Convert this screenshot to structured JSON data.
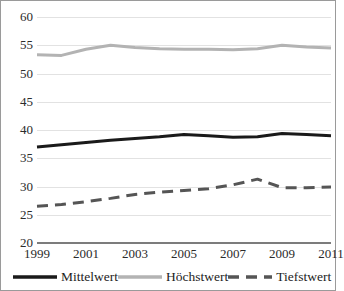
{
  "chart_data": {
    "type": "line",
    "title": "",
    "subtitle": "",
    "xlabel": "",
    "ylabel": "",
    "x": [
      1999,
      2000,
      2001,
      2002,
      2003,
      2004,
      2005,
      2006,
      2007,
      2008,
      2009,
      2010,
      2011
    ],
    "xtick_labels": [
      "1999",
      "2001",
      "2003",
      "2005",
      "2007",
      "2009",
      "2011"
    ],
    "xtick_values": [
      1999,
      2001,
      2003,
      2005,
      2007,
      2009,
      2011
    ],
    "xlim": [
      1999,
      2011
    ],
    "ylim": [
      20,
      60
    ],
    "ytick_labels": [
      "20",
      "25",
      "30",
      "35",
      "40",
      "45",
      "50",
      "55",
      "60"
    ],
    "ytick_values": [
      20,
      25,
      30,
      35,
      40,
      45,
      50,
      55,
      60
    ],
    "grid": true,
    "legend_position": "bottom",
    "series": [
      {
        "name": "Mittelwert",
        "color": "#1a1a1a",
        "style": "solid",
        "width": 3,
        "values": [
          37.0,
          37.4,
          37.8,
          38.2,
          38.5,
          38.8,
          39.2,
          39.0,
          38.7,
          38.8,
          39.4,
          39.2,
          39.0
        ]
      },
      {
        "name": "Höchstwert",
        "color": "#b3b3b3",
        "style": "solid",
        "width": 3,
        "values": [
          53.3,
          53.2,
          54.3,
          55.0,
          54.6,
          54.4,
          54.3,
          54.3,
          54.2,
          54.4,
          55.0,
          54.7,
          54.5
        ]
      },
      {
        "name": "Tiefstwert",
        "color": "#555555",
        "style": "dashed",
        "width": 3,
        "values": [
          26.5,
          26.8,
          27.3,
          27.9,
          28.6,
          29.0,
          29.3,
          29.6,
          30.3,
          31.3,
          29.8,
          29.8,
          29.9
        ]
      }
    ]
  },
  "legend": {
    "entries": [
      {
        "label": "Mittelwert",
        "icon": "solid-line-swatch"
      },
      {
        "label": "Höchstwert",
        "icon": "solid-line-swatch"
      },
      {
        "label": "Tiefstwert",
        "icon": "dashed-line-swatch"
      }
    ]
  }
}
